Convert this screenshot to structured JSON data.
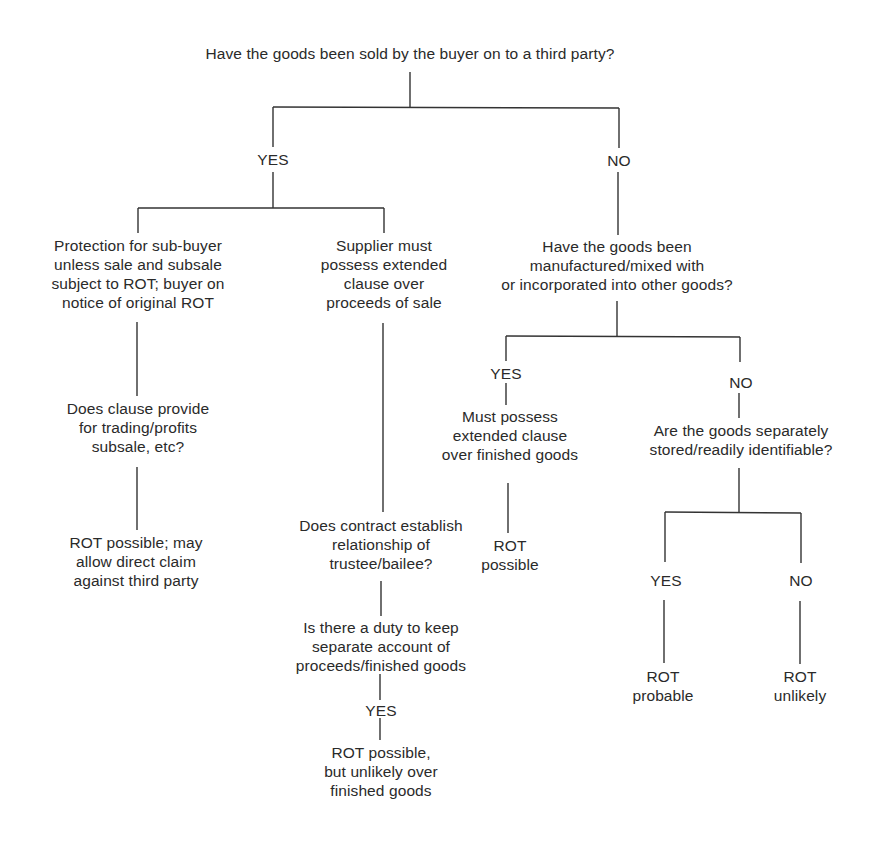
{
  "diagram": {
    "type": "decision-tree",
    "root": {
      "question": "Have the goods been sold by the buyer on to a third party?"
    },
    "branch_labels": {
      "root_yes": "YES",
      "root_no": "NO",
      "mixed_yes": "YES",
      "mixed_no": "NO",
      "stored_yes": "YES",
      "stored_no": "NO",
      "separate_account_yes": "YES"
    },
    "nodes": {
      "protection_sub_buyer": "Protection for sub-buyer\nunless sale and subsale\nsubject to ROT; buyer on\nnotice of original ROT",
      "clause_trading": "Does clause provide\nfor trading/profits\nsubsale, etc?",
      "rot_direct_claim": "ROT possible; may\nallow direct claim\nagainst third party",
      "supplier_extended": "Supplier must\npossess extended\nclause over\nproceeds of sale",
      "trustee_bailee": "Does contract establish\nrelationship of\ntrustee/bailee?",
      "separate_account": "Is there a duty to keep\nseparate account of\nproceeds/finished goods",
      "rot_possible_unlikely": "ROT possible,\nbut unlikely over\nfinished goods",
      "manufactured_mixed": "Have the goods been\nmanufactured/mixed with\nor incorporated into other goods?",
      "extended_finished": "Must possess\nextended clause\nover finished goods",
      "rot_possible": "ROT\npossible",
      "separately_stored": "Are the goods separately\nstored/readily identifiable?",
      "rot_probable": "ROT\nprobable",
      "rot_unlikely": "ROT\nunlikely"
    },
    "colors": {
      "line": "#333333",
      "text": "#2a2a2a",
      "background": "#ffffff"
    }
  }
}
